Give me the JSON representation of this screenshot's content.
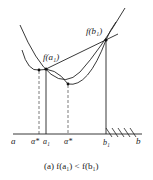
{
  "diagram": {
    "labels": {
      "f_a1": "f(a₁)",
      "f_b1": "f(b₁)",
      "a": "a",
      "alpha_star_left": "α*",
      "a1": "a₁",
      "alpha_star_right": "α*",
      "b1": "b₁",
      "b": "b"
    },
    "caption": "(a)  f(a₁) < f(b₁)",
    "colors": {
      "stroke": "#222222",
      "background": "#ffffff"
    }
  }
}
